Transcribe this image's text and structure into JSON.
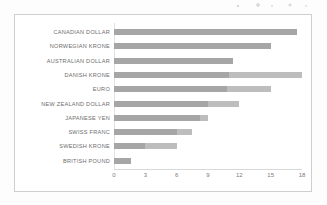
{
  "chart_data": {
    "type": "bar",
    "orientation": "horizontal",
    "title": "",
    "subtitle": "",
    "xlabel": "",
    "ylabel": "",
    "xlim": [
      0,
      18
    ],
    "xticks": [
      0,
      3,
      6,
      9,
      12,
      15,
      18
    ],
    "xtick_labels": [
      "0",
      "3",
      "6",
      "9",
      "12",
      "15",
      "18"
    ],
    "grid": false,
    "legend": "none",
    "categories": [
      "CANADIAN DOLLAR",
      "NORWEGIAN KRONE",
      "AUSTRALIAN DOLLAR",
      "DANISH KRONE",
      "EURO",
      "NEW ZEALAND DOLLAR",
      "JAPANESE YEN",
      "SWISS FRANC",
      "SWEDISH KRONE",
      "BRITISH POUND"
    ],
    "series": [
      {
        "name": "outer",
        "color": "#bdbdbd",
        "values": [
          17.5,
          15.0,
          11.4,
          18.0,
          15.0,
          12.0,
          9.0,
          7.5,
          6.0,
          1.6
        ]
      },
      {
        "name": "inner",
        "color": "#a6a6a6",
        "values": [
          17.5,
          15.0,
          11.4,
          11.0,
          10.8,
          9.0,
          8.2,
          6.0,
          3.0,
          1.6
        ]
      }
    ],
    "bar_color": "#bdbdbd",
    "bar_color_inner": "#a6a6a6",
    "background_color": "#ffffff",
    "border_color": "#cfcfcf",
    "label_color": "#6e6e6e",
    "tick_color": "#7a7a7a"
  }
}
